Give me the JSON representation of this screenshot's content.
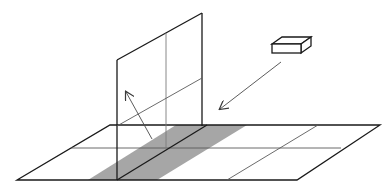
{
  "diagram": {
    "title": "Light source projecting onto vertical panel over floor grid",
    "colors": {
      "background": "#ffffff",
      "line_dark": "#1a1a1a",
      "line_light": "#5a5a5a",
      "shade": "#a6a6a6"
    },
    "elements": {
      "floor": "floor-plane",
      "panel": "vertical-panel",
      "shaded_band": "shaded-strip",
      "box": "light-source-box",
      "incident_arrow": "incident-ray-arrow",
      "reflected_arrow": "reflected-ray-arrow"
    }
  }
}
